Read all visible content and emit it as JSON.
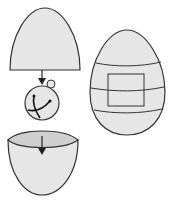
{
  "diagram": {
    "type": "assembly-illustration",
    "colors": {
      "stroke": "#333333",
      "fill": "#e6e6e6",
      "fill_inner": "#cfcfcf",
      "background": "#ffffff"
    },
    "parts": [
      {
        "id": "egg-top-half",
        "label": ""
      },
      {
        "id": "arrow-down-1",
        "label": ""
      },
      {
        "id": "bell-ball",
        "label": ""
      },
      {
        "id": "arrow-down-2",
        "label": ""
      },
      {
        "id": "egg-bottom-half",
        "label": ""
      },
      {
        "id": "assembled-egg-with-label",
        "label": ""
      }
    ]
  }
}
